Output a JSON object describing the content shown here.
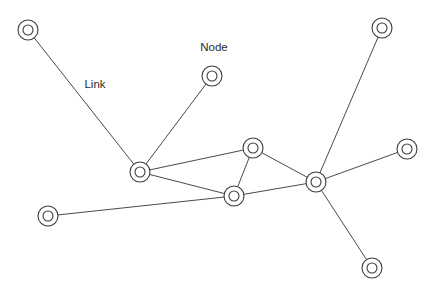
{
  "diagram": {
    "type": "network-graph",
    "background_color": "#ffffff",
    "node_stroke_color": "#3c3c3c",
    "node_fill_color": "#ffffff",
    "edge_color": "#4a4a4a",
    "label_color": "#2b2b2b",
    "node_outer_radius": 10,
    "node_inner_radius": 5,
    "nodes": [
      {
        "id": "n1",
        "name": "node-top-left",
        "x": 28,
        "y": 30
      },
      {
        "id": "n2",
        "name": "node-labeled-node",
        "x": 212,
        "y": 76
      },
      {
        "id": "n3",
        "name": "node-top-right",
        "x": 382,
        "y": 28
      },
      {
        "id": "n4",
        "name": "node-left-hub",
        "x": 140,
        "y": 172
      },
      {
        "id": "n5",
        "name": "node-upper-center",
        "x": 253,
        "y": 148
      },
      {
        "id": "n6",
        "name": "node-center-bottom",
        "x": 234,
        "y": 196
      },
      {
        "id": "n7",
        "name": "node-right-hub",
        "x": 316,
        "y": 182
      },
      {
        "id": "n8",
        "name": "node-mid-right",
        "x": 407,
        "y": 149
      },
      {
        "id": "n9",
        "name": "node-bottom-left",
        "x": 48,
        "y": 216
      },
      {
        "id": "n10",
        "name": "node-bottom-right",
        "x": 372,
        "y": 268
      }
    ],
    "edges": [
      {
        "id": "e1",
        "name": "link-top-left-to-left-hub",
        "from": "n1",
        "to": "n4"
      },
      {
        "id": "e2",
        "name": "link-labeled-node-to-left-hub",
        "from": "n2",
        "to": "n4"
      },
      {
        "id": "e3",
        "name": "link-left-hub-to-upper-center",
        "from": "n4",
        "to": "n5"
      },
      {
        "id": "e4",
        "name": "link-left-hub-to-center-bottom",
        "from": "n4",
        "to": "n6"
      },
      {
        "id": "e5",
        "name": "link-upper-center-to-center-bottom",
        "from": "n5",
        "to": "n6"
      },
      {
        "id": "e6",
        "name": "link-upper-center-to-right-hub",
        "from": "n5",
        "to": "n7"
      },
      {
        "id": "e7",
        "name": "link-center-bottom-to-right-hub",
        "from": "n6",
        "to": "n7"
      },
      {
        "id": "e8",
        "name": "link-bottom-left-to-center-bottom",
        "from": "n9",
        "to": "n6"
      },
      {
        "id": "e9",
        "name": "link-right-hub-to-top-right",
        "from": "n7",
        "to": "n3"
      },
      {
        "id": "e10",
        "name": "link-right-hub-to-mid-right",
        "from": "n7",
        "to": "n8"
      },
      {
        "id": "e11",
        "name": "link-right-hub-to-bottom-right",
        "from": "n7",
        "to": "n10"
      }
    ],
    "labels": [
      {
        "id": "l1",
        "name": "node-annotation-label",
        "text": "Node",
        "x": 214,
        "y": 48,
        "anchor": "middle"
      },
      {
        "id": "l2",
        "name": "link-annotation-label",
        "text": "Link",
        "x": 95,
        "y": 85,
        "anchor": "middle"
      }
    ]
  }
}
